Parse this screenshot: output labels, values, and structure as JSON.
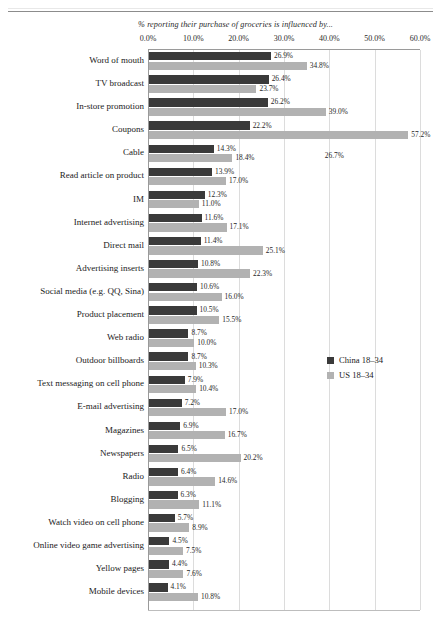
{
  "header": {
    "rule": "horizontal-rule"
  },
  "chart_data": {
    "type": "bar",
    "orientation": "horizontal",
    "title": "% reporting their purchase of groceries is influenced by...",
    "xlabel": "",
    "ylabel": "",
    "xlim": [
      0,
      60
    ],
    "xticks": [
      "0.0%",
      "10.0%",
      "20.0%",
      "30.0%",
      "40.0%",
      "50.0%",
      "60.0%"
    ],
    "xtick_values": [
      0,
      10,
      20,
      30,
      40,
      50,
      60
    ],
    "grid": true,
    "legend_position": "middle-right",
    "categories": [
      "Word of mouth",
      "TV broadcast",
      "In-store promotion",
      "Coupons",
      "Cable",
      "Read article on product",
      "IM",
      "Internet advertising",
      "Direct mail",
      "Advertising inserts",
      "Social media (e.g. QQ, Sina)",
      "Product placement",
      "Web radio",
      "Outdoor billboards",
      "Text messaging on cell phone",
      "E-mail advertising",
      "Magazines",
      "Newspapers",
      "Radio",
      "Blogging",
      "Watch video on cell phone",
      "Online video game advertising",
      "Yellow pages",
      "Mobile devices"
    ],
    "series": [
      {
        "name": "China 18–34",
        "color": "#3a3a3a",
        "values": [
          26.9,
          26.4,
          26.2,
          22.2,
          14.3,
          13.9,
          12.3,
          11.6,
          11.4,
          10.8,
          10.6,
          10.5,
          8.7,
          8.7,
          7.9,
          7.2,
          6.9,
          6.5,
          6.4,
          6.3,
          5.7,
          4.5,
          4.4,
          4.1
        ],
        "labels": [
          "26.9%",
          "26.4%",
          "26.2%",
          "22.2%",
          "14.3%",
          "13.9%",
          "12.3%",
          "11.6%",
          "11.4%",
          "10.8%",
          "10.6%",
          "10.5%",
          "8.7%",
          "8.7%",
          "7.9%",
          "7.2%",
          "6.9%",
          "6.5%",
          "6.4%",
          "6.3%",
          "5.7%",
          "4.5%",
          "4.4%",
          "4.1%"
        ]
      },
      {
        "name": "US 18–34",
        "color": "#b2b2b2",
        "values": [
          34.8,
          23.7,
          39.0,
          57.2,
          18.4,
          17.0,
          11.0,
          17.1,
          25.1,
          22.3,
          16.0,
          15.5,
          10.0,
          10.3,
          10.4,
          17.0,
          16.7,
          20.2,
          14.6,
          11.1,
          8.9,
          7.5,
          7.6,
          10.8
        ],
        "labels": [
          "34.8%",
          "23.7%",
          "39.0%",
          "57.2%",
          "18.4%",
          "17.0%",
          "11.0%",
          "17.1%",
          "25.1%",
          "22.3%",
          "16.0%",
          "15.5%",
          "10.0%",
          "10.3%",
          "10.4%",
          "17.0%",
          "16.7%",
          "20.2%",
          "14.6%",
          "11.1%",
          "8.9%",
          "7.5%",
          "7.6%",
          "10.8%"
        ]
      }
    ],
    "annotations": [
      {
        "text": "26.7%",
        "x_pct": 39.0,
        "row_index": 4
      }
    ]
  },
  "legend": {
    "items": [
      {
        "label": "China 18–34",
        "color": "#3a3a3a"
      },
      {
        "label": "US 18–34",
        "color": "#b2b2b2"
      }
    ]
  }
}
